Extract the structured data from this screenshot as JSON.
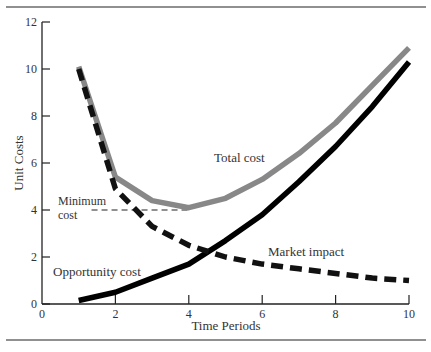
{
  "chart_data": {
    "type": "line",
    "title": "",
    "xlabel": "Time Periods",
    "ylabel": "Unit Costs",
    "xlim": [
      0,
      10
    ],
    "ylim": [
      0,
      12
    ],
    "x_ticks": [
      "0",
      "2",
      "4",
      "6",
      "8",
      "10"
    ],
    "y_ticks": [
      "0",
      "2",
      "4",
      "6",
      "8",
      "10",
      "12"
    ],
    "grid": false,
    "legend": "inline labels",
    "x": [
      1,
      2,
      3,
      4,
      5,
      6,
      7,
      8,
      9,
      10
    ],
    "series": [
      {
        "name": "Total cost",
        "color": "#888888",
        "style": "solid",
        "values": [
          10.1,
          5.4,
          4.4,
          4.1,
          4.5,
          5.3,
          6.4,
          7.7,
          9.3,
          10.9
        ]
      },
      {
        "name": "Market impact",
        "color": "#111111",
        "style": "dashed",
        "values": [
          10.0,
          4.9,
          3.3,
          2.5,
          2.0,
          1.7,
          1.5,
          1.3,
          1.1,
          1.0
        ]
      },
      {
        "name": "Opportunity cost",
        "color": "#000000",
        "style": "solid",
        "values": [
          0.15,
          0.5,
          1.1,
          1.7,
          2.7,
          3.8,
          5.2,
          6.7,
          8.4,
          10.3
        ]
      }
    ],
    "annotations": [
      {
        "text": "Minimum cost",
        "x_range": [
          1.4,
          4
        ],
        "y": 4.0,
        "style": "dashed"
      },
      {
        "text": "Total cost"
      },
      {
        "text": "Market impact"
      },
      {
        "text": "Opportunity cost"
      }
    ]
  },
  "labels": {
    "total_cost": "Total cost",
    "market_impact": "Market impact",
    "opportunity_cost": "Opportunity cost",
    "minimum_line1": "Minimum",
    "minimum_line2": "cost",
    "xlabel": "Time Periods",
    "ylabel": "Unit Costs"
  }
}
